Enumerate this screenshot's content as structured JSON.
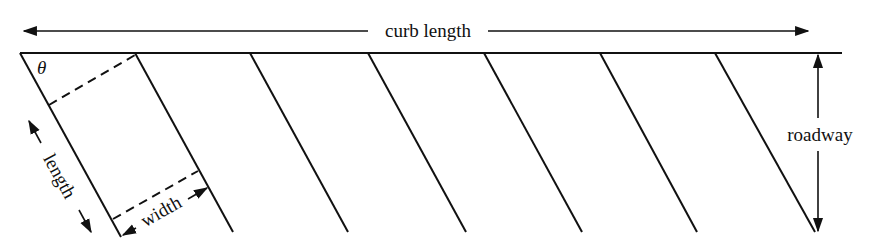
{
  "diagram": {
    "type": "angled-parking-layout",
    "stroke_color": "#111111",
    "background": "#ffffff",
    "labels": {
      "curb_length": "curb length",
      "roadway": "roadway",
      "length": "length",
      "width": "width",
      "angle": "θ"
    },
    "stall_lines_count": 7
  }
}
